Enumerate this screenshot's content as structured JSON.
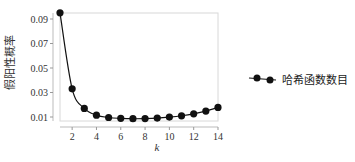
{
  "chart_data": {
    "type": "line",
    "title": "",
    "xlabel": "k",
    "ylabel": "假阳性概率",
    "x": [
      1,
      2,
      3,
      4,
      5,
      6,
      7,
      8,
      9,
      10,
      11,
      12,
      13,
      14
    ],
    "series": [
      {
        "name": "哈希函数数目",
        "values": [
          0.095,
          0.033,
          0.017,
          0.0115,
          0.0096,
          0.0089,
          0.0086,
          0.0087,
          0.0091,
          0.0099,
          0.011,
          0.0126,
          0.0148,
          0.0178
        ]
      }
    ],
    "xticks": [
      "2",
      "4",
      "6",
      "8",
      "10",
      "12",
      "14"
    ],
    "yticks": [
      "0.01",
      "0.03",
      "0.05",
      "0.07",
      "0.09"
    ],
    "xlim": [
      1,
      14
    ],
    "ylim": [
      0.008,
      0.095
    ],
    "grid": false,
    "legend_position": "right",
    "line_color": "#111111",
    "marker": "circle"
  }
}
